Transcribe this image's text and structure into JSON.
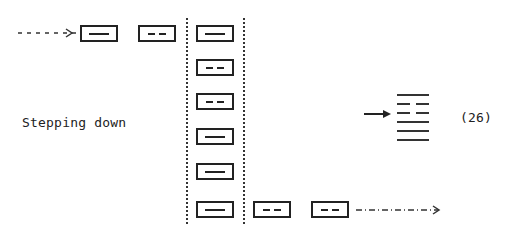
{
  "diagram": {
    "label": "Stepping down",
    "equation_number": "(26)",
    "top_row": [
      {
        "type": "solid",
        "x": 80,
        "y": 25
      },
      {
        "type": "broken",
        "x": 138,
        "y": 25
      }
    ],
    "column": [
      {
        "type": "solid",
        "x": 196,
        "y": 25
      },
      {
        "type": "broken",
        "x": 196,
        "y": 59
      },
      {
        "type": "broken",
        "x": 196,
        "y": 93
      },
      {
        "type": "solid",
        "x": 196,
        "y": 128
      },
      {
        "type": "solid",
        "x": 196,
        "y": 163
      },
      {
        "type": "solid",
        "x": 196,
        "y": 201
      }
    ],
    "bottom_row": [
      {
        "type": "broken",
        "x": 253,
        "y": 201
      },
      {
        "type": "broken",
        "x": 311,
        "y": 201
      }
    ],
    "hexagram_lines_top_to_bottom": [
      "solid",
      "broken",
      "broken",
      "solid",
      "solid",
      "solid"
    ],
    "colors": {
      "ink": "#222222",
      "background": "#ffffff"
    }
  }
}
